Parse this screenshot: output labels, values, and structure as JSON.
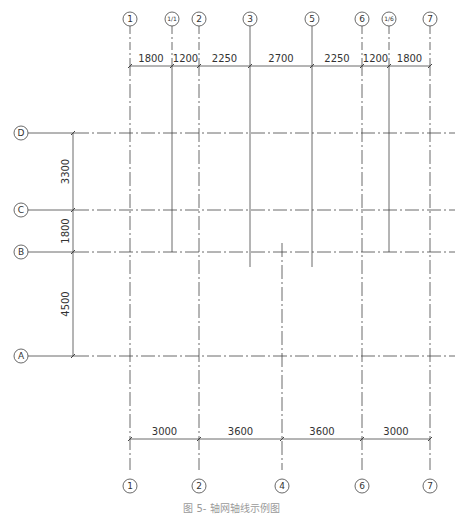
{
  "diagram": {
    "type": "structural-grid-plan",
    "colors": {
      "line": "#444444",
      "text": "#333333",
      "caption": "#9a9a9a"
    },
    "vertical_axes_top": [
      {
        "label": "1",
        "x": 130
      },
      {
        "label": "1/1",
        "x": 172
      },
      {
        "label": "2",
        "x": 199
      },
      {
        "label": "3",
        "x": 250
      },
      {
        "label": "5",
        "x": 312
      },
      {
        "label": "6",
        "x": 362
      },
      {
        "label": "1/6",
        "x": 389
      },
      {
        "label": "7",
        "x": 430
      }
    ],
    "vertical_axes_bottom": [
      {
        "label": "1",
        "x": 130
      },
      {
        "label": "2",
        "x": 199
      },
      {
        "label": "4",
        "x": 282
      },
      {
        "label": "6",
        "x": 362
      },
      {
        "label": "7",
        "x": 430
      }
    ],
    "horizontal_axes": [
      {
        "label": "D",
        "y": 133
      },
      {
        "label": "C",
        "y": 210
      },
      {
        "label": "B",
        "y": 252
      },
      {
        "label": "A",
        "y": 356
      }
    ],
    "top_dimensions": [
      "1800",
      "1200",
      "2250",
      "2700",
      "2250",
      "1200",
      "1800"
    ],
    "bottom_dimensions": [
      "3000",
      "3600",
      "3600",
      "3000"
    ],
    "left_dimensions": [
      "3300",
      "1800",
      "4500"
    ],
    "caption": "图 5-   轴网轴线示例图"
  }
}
